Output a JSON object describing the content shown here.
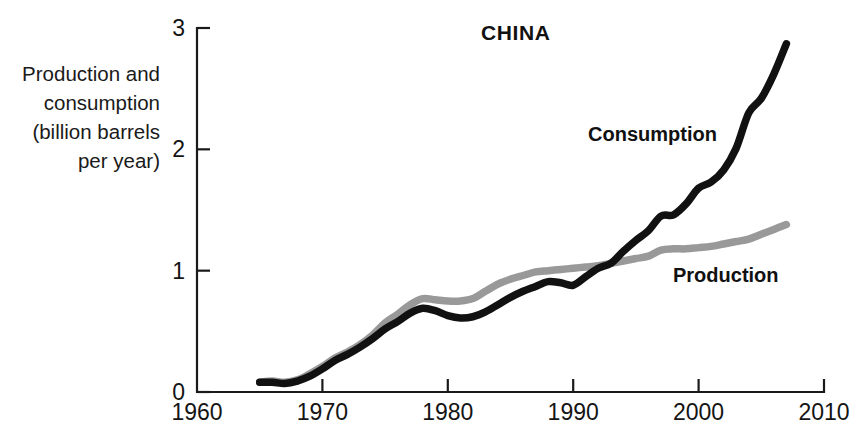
{
  "chart_data": {
    "type": "line",
    "title": "CHINA",
    "xlabel": "",
    "ylabel": "Production and consumption (billion barrels per year)",
    "ylabel_lines": [
      "Production and",
      "consumption",
      "(billion barrels",
      "per year)"
    ],
    "xlim": [
      1960,
      2010
    ],
    "ylim": [
      0,
      3
    ],
    "xticks": [
      1960,
      1970,
      1980,
      1990,
      2000,
      2010
    ],
    "xtick_labels": [
      "1960",
      "1970",
      "1980",
      "1990",
      "2000",
      "2010"
    ],
    "yticks": [
      0,
      1,
      2,
      3
    ],
    "ytick_labels": [
      "0",
      "1",
      "2",
      "3"
    ],
    "grid": false,
    "legend_position": "inline-annotations",
    "colors": {
      "consumption": "#111111",
      "production": "#999999",
      "axis": "#1a1a1a",
      "background": "#ffffff"
    },
    "series": [
      {
        "name": "Production",
        "color": "#999999",
        "label_annotation": "Production",
        "x": [
          1965,
          1966,
          1967,
          1968,
          1969,
          1970,
          1971,
          1972,
          1973,
          1974,
          1975,
          1976,
          1977,
          1978,
          1979,
          1980,
          1981,
          1982,
          1983,
          1984,
          1985,
          1986,
          1987,
          1988,
          1989,
          1990,
          1991,
          1992,
          1993,
          1994,
          1995,
          1996,
          1997,
          1998,
          1999,
          2000,
          2001,
          2002,
          2003,
          2004,
          2005,
          2006,
          2007
        ],
        "values": [
          0.08,
          0.09,
          0.08,
          0.1,
          0.15,
          0.21,
          0.28,
          0.33,
          0.39,
          0.47,
          0.57,
          0.64,
          0.72,
          0.77,
          0.76,
          0.75,
          0.75,
          0.77,
          0.83,
          0.89,
          0.93,
          0.96,
          0.99,
          1.0,
          1.01,
          1.02,
          1.03,
          1.04,
          1.06,
          1.08,
          1.1,
          1.12,
          1.17,
          1.18,
          1.18,
          1.19,
          1.2,
          1.22,
          1.24,
          1.26,
          1.3,
          1.34,
          1.38
        ]
      },
      {
        "name": "Consumption",
        "color": "#111111",
        "label_annotation": "Consumption",
        "x": [
          1965,
          1966,
          1967,
          1968,
          1969,
          1970,
          1971,
          1972,
          1973,
          1974,
          1975,
          1976,
          1977,
          1978,
          1979,
          1980,
          1981,
          1982,
          1983,
          1984,
          1985,
          1986,
          1987,
          1988,
          1989,
          1990,
          1991,
          1992,
          1993,
          1994,
          1995,
          1996,
          1997,
          1998,
          1999,
          2000,
          2001,
          2002,
          2003,
          2004,
          2005,
          2006,
          2007
        ],
        "values": [
          0.08,
          0.08,
          0.07,
          0.09,
          0.13,
          0.19,
          0.26,
          0.31,
          0.37,
          0.44,
          0.52,
          0.58,
          0.65,
          0.69,
          0.67,
          0.63,
          0.61,
          0.62,
          0.66,
          0.72,
          0.78,
          0.83,
          0.87,
          0.91,
          0.9,
          0.88,
          0.95,
          1.02,
          1.06,
          1.16,
          1.25,
          1.33,
          1.45,
          1.46,
          1.55,
          1.68,
          1.73,
          1.83,
          2.01,
          2.3,
          2.42,
          2.62,
          2.87
        ]
      }
    ],
    "annotations": [
      {
        "text": "CHINA",
        "x_px": 481,
        "y_px": 40,
        "name": "chart-title"
      },
      {
        "text": "Consumption",
        "x_px": 588,
        "y_px": 141,
        "name": "series-label-consumption"
      },
      {
        "text": "Production",
        "x_px": 673,
        "y_px": 282,
        "name": "series-label-production"
      }
    ]
  }
}
